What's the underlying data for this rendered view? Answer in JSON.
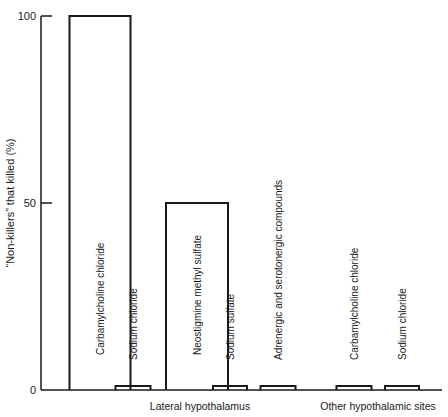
{
  "chart_data": {
    "type": "bar",
    "title": "",
    "xlabel": "",
    "ylabel": "“Non-killers” that killed (%)",
    "ylim": [
      0,
      100
    ],
    "yticks": [
      "0",
      "50",
      "100"
    ],
    "ytick_values": [
      0,
      50,
      100
    ],
    "grid": false,
    "legend": "none",
    "categories": [
      "Carbamylcholine chloride",
      "Sodium chloride",
      "Neostigmine methyl sulfate",
      "Sodium sulfate",
      "Adrenergic and serotonergic compounds",
      "Carbamylcholine chloride",
      "Sodium chloride"
    ],
    "values": [
      100,
      1,
      50,
      1,
      1,
      1,
      1
    ],
    "groups": [
      {
        "label": "Lateral hypothalamus",
        "members": [
          0,
          1,
          2,
          3,
          4
        ]
      },
      {
        "label": "Other hypothalamic sites",
        "members": [
          5,
          6
        ]
      }
    ]
  }
}
